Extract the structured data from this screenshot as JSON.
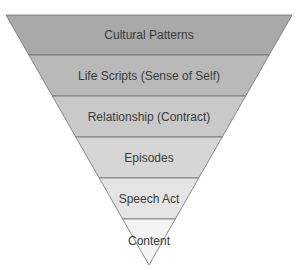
{
  "diagram": {
    "type": "inverted-pyramid",
    "levels": [
      {
        "label": "Cultural Patterns",
        "color": "#a9a9a9"
      },
      {
        "label": "Life Scripts (Sense of Self)",
        "color": "#b9b9b9"
      },
      {
        "label": "Relationship (Contract)",
        "color": "#c9c9c9"
      },
      {
        "label": "Episodes",
        "color": "#d6d6d6"
      },
      {
        "label": "Speech Act",
        "color": "#e4e4e4"
      },
      {
        "label": "Content",
        "color": "#f4f4f4"
      }
    ],
    "line_color": "#6e6e6e"
  }
}
